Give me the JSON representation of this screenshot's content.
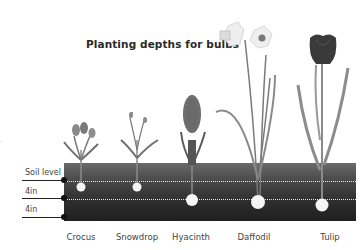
{
  "title": "Planting depths for bulbs",
  "depth_labels": {
    "soil_level": "Soil level",
    "first_depth": "4in",
    "second_depth": "4in"
  },
  "plants": [
    {
      "name": "Crocus",
      "bulb_depth": "4in"
    },
    {
      "name": "Snowdrop",
      "bulb_depth": "4in"
    },
    {
      "name": "Hyacinth",
      "bulb_depth": "8in"
    },
    {
      "name": "Daffodil",
      "bulb_depth": "8in"
    },
    {
      "name": "Tulip",
      "bulb_depth": "8in"
    }
  ],
  "colors": {
    "soil_top": "#6a6a6a",
    "soil_bottom": "#1f1f1f",
    "stem": "#8a8a8a",
    "bulb": "#f5f5f5"
  },
  "corner_mark": "."
}
